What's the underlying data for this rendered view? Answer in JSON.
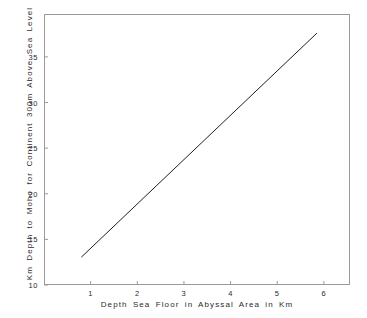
{
  "figure": {
    "background_color": "#ffffff",
    "frame_color": "#9a9a9a",
    "line_color": "#1f1f1f"
  },
  "chart_data": {
    "type": "line",
    "title": "",
    "subtitle": "",
    "xlabel": "Depth Sea Floor in Abyssal Area in Km",
    "ylabel": "Km Depth to Moho for Continent 300m Above Sea Level",
    "xlim": [
      0.0,
      6.56
    ],
    "ylim": [
      10.0,
      39.7
    ],
    "xticks": [
      1,
      2,
      3,
      4,
      5,
      6
    ],
    "xtick_labels": [
      "1",
      "2",
      "3",
      "4",
      "5",
      "6"
    ],
    "yticks": [
      10,
      15,
      20,
      25,
      30,
      35
    ],
    "ytick_labels": [
      "10",
      "15",
      "20",
      "25",
      "30",
      "35"
    ],
    "grid": false,
    "legend": null,
    "legend_position": "none",
    "annotations": [],
    "series": [
      {
        "name": "Moho depth vs abyssal sea floor depth",
        "color": "#1f1f1f",
        "width": 1,
        "x": [
          0.8,
          5.85
        ],
        "y": [
          13.05,
          37.6
        ]
      }
    ]
  }
}
